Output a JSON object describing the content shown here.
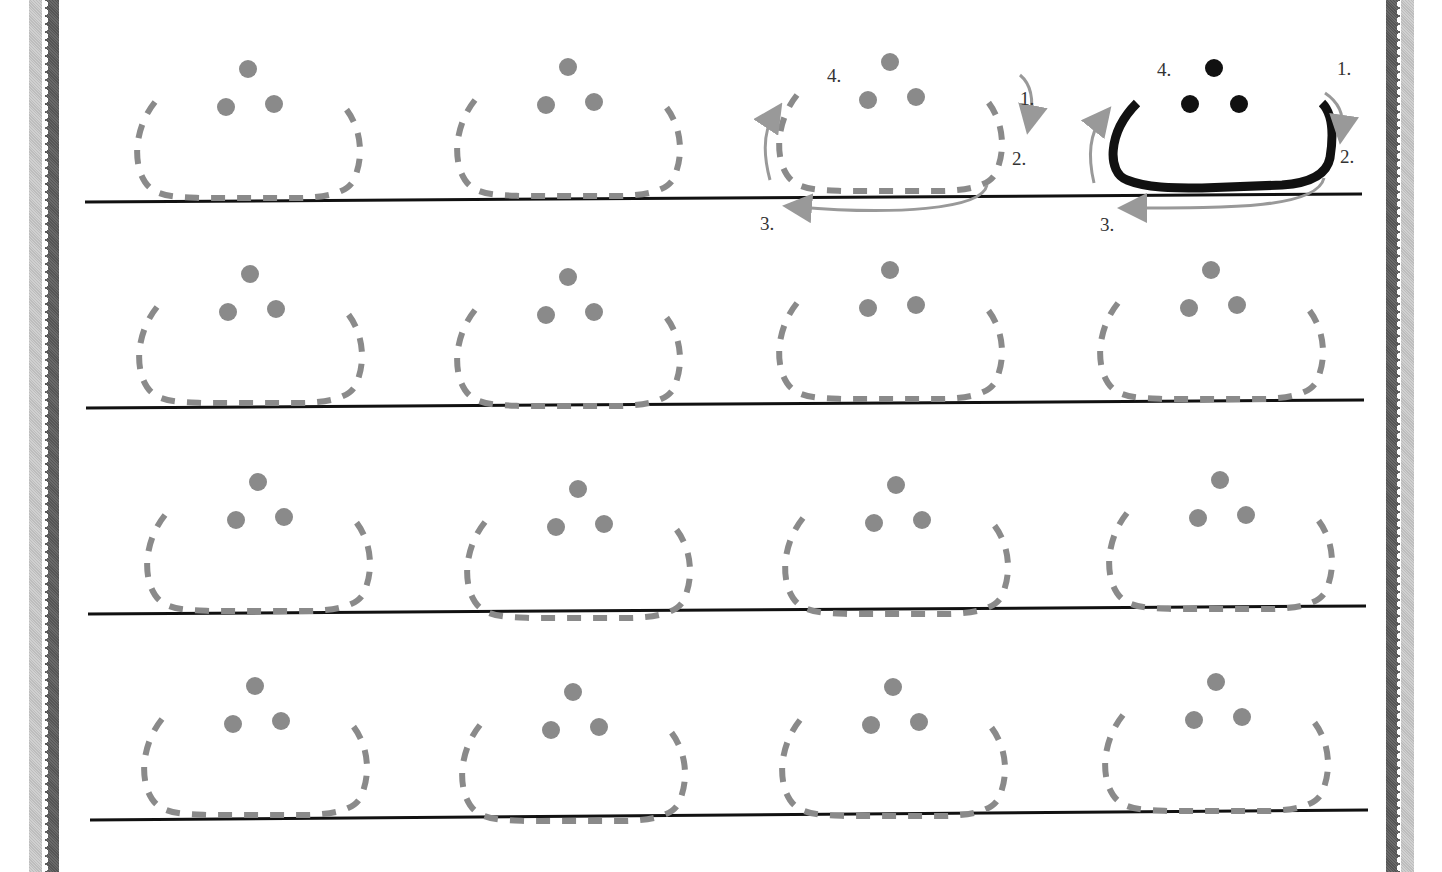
{
  "worksheet": {
    "letter_name": "Arabic letter Tha (ث) tracing",
    "model_letter": {
      "stroke_color": "#111111",
      "dots": 3,
      "steps": [
        "1.",
        "2.",
        "3.",
        "4."
      ]
    },
    "guide_letter": {
      "stroke_color": "#8a8a8a",
      "dots": 3,
      "steps": [
        "1.",
        "2.",
        "3.",
        "4."
      ]
    },
    "rows": 4,
    "columns": 4,
    "trace_color": "#8a8a8a",
    "baseline_color": "#111111",
    "border_colors": {
      "dark": "#5f5f5f",
      "light": "#c8c8c8"
    }
  }
}
